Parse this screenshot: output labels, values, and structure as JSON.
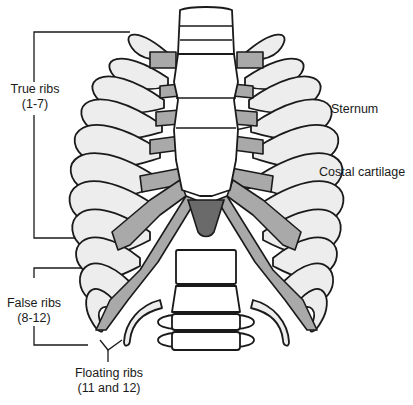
{
  "diagram": {
    "colors": {
      "bone": "#ededed",
      "outline": "#1a1a1a",
      "costal_cartilage": "#a9a9a9",
      "xiphoid": "#6a6a6a",
      "background": "#ffffff"
    }
  },
  "labels": {
    "true_ribs": {
      "title": "True ribs",
      "range": "(1-7)"
    },
    "false_ribs": {
      "title": "False ribs",
      "range": "(8-12)"
    },
    "floating_ribs": {
      "title": "Floating ribs",
      "range": "(11 and 12)"
    },
    "sternum": {
      "title": "Sternum"
    },
    "costal_cartilage": {
      "title": "Costal cartilage"
    }
  }
}
